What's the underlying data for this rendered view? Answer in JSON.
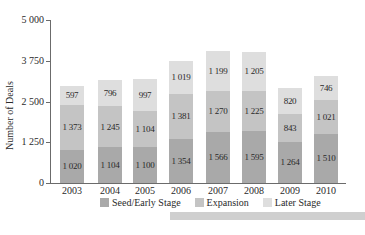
{
  "chart_data": {
    "type": "bar",
    "stacked": true,
    "title": "",
    "xlabel": "",
    "ylabel": "Number of Deals",
    "ylim": [
      0,
      5000
    ],
    "yticks": [
      0,
      1250,
      2500,
      3750,
      5000
    ],
    "ytick_labels": [
      "0",
      "1 250",
      "2 500",
      "3 750",
      "5 000"
    ],
    "grid": false,
    "legend_position": "bottom",
    "categories": [
      "2003",
      "2004",
      "2005",
      "2006",
      "2007",
      "2008",
      "2009",
      "2010"
    ],
    "series": [
      {
        "name": "Seed/Early Stage",
        "color": "#a9a9a9",
        "values": [
          1020,
          1104,
          1100,
          1354,
          1566,
          1595,
          1264,
          1510
        ],
        "labels": [
          "1 020",
          "1 104",
          "1 100",
          "1 354",
          "1 566",
          "1 595",
          "1 264",
          "1 510"
        ]
      },
      {
        "name": "Expansion",
        "color": "#c4c4c4",
        "values": [
          1373,
          1245,
          1104,
          1381,
          1270,
          1225,
          843,
          1021
        ],
        "labels": [
          "1 373",
          "1 245",
          "1 104",
          "1 381",
          "1 270",
          "1 225",
          "843",
          "1 021"
        ]
      },
      {
        "name": "Later Stage",
        "color": "#dedede",
        "values": [
          597,
          796,
          997,
          1019,
          1199,
          1205,
          820,
          746
        ],
        "labels": [
          "597",
          "796",
          "997",
          "1 019",
          "1 199",
          "1 205",
          "820",
          "746"
        ]
      }
    ]
  },
  "legend": {
    "items": [
      "Seed/Early Stage",
      "Expansion",
      "Later Stage"
    ]
  }
}
